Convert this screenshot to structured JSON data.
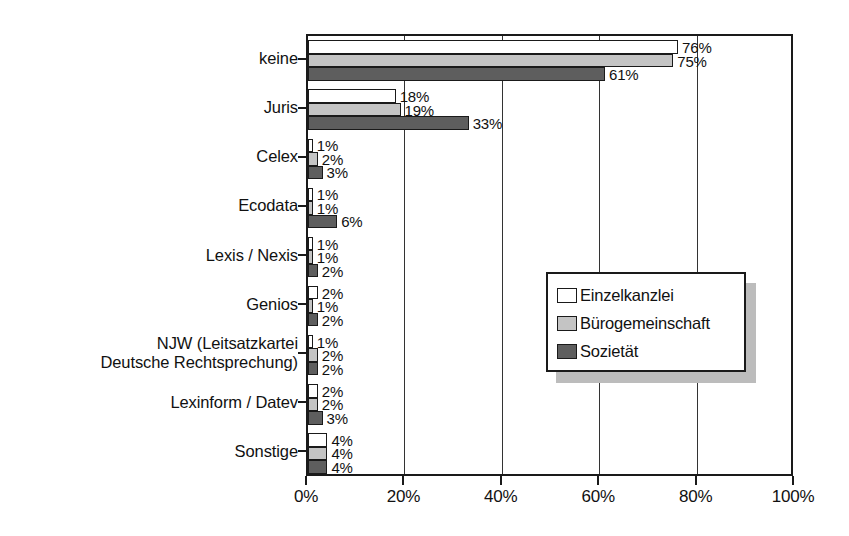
{
  "chart_data": {
    "type": "bar",
    "orientation": "horizontal",
    "title": "",
    "xlabel": "",
    "ylabel": "",
    "xlim": [
      0,
      100
    ],
    "xticks": [
      "0%",
      "20%",
      "40%",
      "60%",
      "80%",
      "100%"
    ],
    "xtick_values": [
      0,
      20,
      40,
      60,
      80,
      100
    ],
    "grid": true,
    "legend_position": "center-right",
    "categories": [
      "keine",
      "Juris",
      "Celex",
      "Ecodata",
      "Lexis / Nexis",
      "Genios",
      "NJW (Leitsatzkartei\nDeutsche Rechtsprechung)",
      "Lexinform / Datev",
      "Sonstige"
    ],
    "category_lines": [
      [
        "keine"
      ],
      [
        "Juris"
      ],
      [
        "Celex"
      ],
      [
        "Ecodata"
      ],
      [
        "Lexis / Nexis"
      ],
      [
        "Genios"
      ],
      [
        "NJW (Leitsatzkartei",
        "Deutsche Rechtsprechung)"
      ],
      [
        "Lexinform / Datev"
      ],
      [
        "Sonstige"
      ]
    ],
    "series": [
      {
        "name": "Einzelkanzlei",
        "color": "#ffffff",
        "values": [
          76,
          18,
          1,
          1,
          1,
          2,
          1,
          2,
          4
        ],
        "labels": [
          "76%",
          "18%",
          "1%",
          "1%",
          "1%",
          "2%",
          "1%",
          "2%",
          "4%"
        ]
      },
      {
        "name": "Bürogemeinschaft",
        "color": "#c4c4c4",
        "values": [
          75,
          19,
          2,
          1,
          1,
          1,
          2,
          2,
          4
        ],
        "labels": [
          "75%",
          "19%",
          "2%",
          "1%",
          "1%",
          "1%",
          "2%",
          "2%",
          "4%"
        ]
      },
      {
        "name": "Sozietät",
        "color": "#5e5e5e",
        "values": [
          61,
          33,
          3,
          6,
          2,
          2,
          2,
          3,
          4
        ],
        "labels": [
          "61%",
          "33%",
          "3%",
          "6%",
          "2%",
          "2%",
          "2%",
          "3%",
          "4%"
        ]
      }
    ]
  },
  "legend": {
    "items": [
      {
        "label": "Einzelkanzlei",
        "swatch": "s0"
      },
      {
        "label": "Bürogemeinschaft",
        "swatch": "s1"
      },
      {
        "label": "Sozietät",
        "swatch": "s2"
      }
    ]
  }
}
